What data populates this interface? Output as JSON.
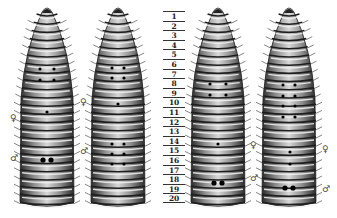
{
  "figure": {
    "segment_numbers": [
      "1",
      "2",
      "3",
      "4",
      "5",
      "6",
      "7",
      "8",
      "9",
      "10",
      "11",
      "12",
      "13",
      "14",
      "15",
      "16",
      "17",
      "18",
      "19",
      "20"
    ],
    "symbols": {
      "female": "♀",
      "male": "♂"
    },
    "worms": [
      {
        "id": "worm-1",
        "center_x": 47,
        "female_symbol_y": 119,
        "male_symbol_y": 159,
        "pores": [
          [
            -7,
            69
          ],
          [
            7,
            69
          ],
          [
            -7,
            80
          ],
          [
            7,
            80
          ],
          [
            0,
            112
          ],
          [
            -4,
            160
          ],
          [
            4,
            160
          ]
        ],
        "male_pore_segment": 15
      },
      {
        "id": "worm-2",
        "center_x": 118,
        "female_symbol_y": 103,
        "male_symbol_y": 152,
        "pores": [
          [
            -6,
            68
          ],
          [
            6,
            68
          ],
          [
            -6,
            78
          ],
          [
            6,
            78
          ],
          [
            0,
            104
          ],
          [
            -6,
            144
          ],
          [
            6,
            144
          ],
          [
            -6,
            154
          ],
          [
            6,
            154
          ],
          [
            -6,
            164
          ],
          [
            6,
            164
          ]
        ],
        "male_pore_segment": 15
      },
      {
        "id": "worm-3",
        "center_x": 218,
        "female_symbol_y": 146,
        "male_symbol_y": 179,
        "pores": [
          [
            -8,
            84
          ],
          [
            8,
            84
          ],
          [
            -8,
            95
          ],
          [
            8,
            95
          ],
          [
            0,
            144
          ],
          [
            -4,
            183
          ],
          [
            4,
            183
          ]
        ],
        "male_pore_segment": 18
      },
      {
        "id": "worm-4",
        "center_x": 289,
        "female_symbol_y": 150,
        "male_symbol_y": 190,
        "pores": [
          [
            -6,
            85
          ],
          [
            6,
            85
          ],
          [
            -6,
            96
          ],
          [
            6,
            96
          ],
          [
            -6,
            106
          ],
          [
            6,
            106
          ],
          [
            -6,
            117
          ],
          [
            6,
            117
          ],
          [
            1,
            152
          ],
          [
            1,
            164
          ],
          [
            -4,
            188
          ],
          [
            4,
            188
          ]
        ],
        "male_pore_segment": 18
      }
    ]
  }
}
